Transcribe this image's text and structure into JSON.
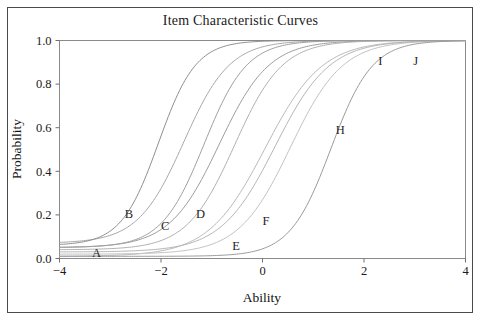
{
  "figure": {
    "title": "Item Characteristic Curves",
    "background_color": "#ffffff",
    "frame_color": "#4a4a4a"
  },
  "chart_data": {
    "type": "line",
    "title": "Item Characteristic Curves",
    "xlabel": "Ability",
    "ylabel": "Probability",
    "xlim": [
      -4,
      4
    ],
    "ylim": [
      0.0,
      1.0
    ],
    "xticks": [
      -4,
      -2,
      0,
      2,
      4
    ],
    "xtick_labels": [
      "−4",
      "−2",
      "0",
      "2",
      "4"
    ],
    "yticks": [
      0.0,
      0.2,
      0.4,
      0.6,
      0.8,
      1.0
    ],
    "ytick_labels": [
      "0.0",
      "0.2",
      "0.4",
      "0.6",
      "0.8",
      "1.0"
    ],
    "grid": false,
    "legend": "inline-labels",
    "model": "3PL logistic item characteristic curves",
    "x": [
      -4,
      -3.5,
      -3,
      -2.5,
      -2,
      -1.5,
      -1,
      -0.5,
      0,
      0.5,
      1,
      1.5,
      2,
      2.5,
      3,
      3.5,
      4
    ],
    "series": [
      {
        "name": "A",
        "label": "A",
        "label_x": -3.27,
        "label_y": 0.025,
        "color": "#b9b9b9",
        "discrimination": 1.05,
        "difficulty": 0.05,
        "guessing": 0.01,
        "values": [
          0.02,
          0.026,
          0.035,
          0.049,
          0.073,
          0.112,
          0.173,
          0.264,
          0.385,
          0.523,
          0.655,
          0.762,
          0.841,
          0.895,
          0.931,
          0.954,
          0.97
        ]
      },
      {
        "name": "B",
        "label": "B",
        "label_x": -2.63,
        "label_y": 0.205,
        "color": "#a8a8a8",
        "discrimination": 1.3,
        "difficulty": -1.55,
        "guessing": 0.07,
        "values": [
          0.09,
          0.118,
          0.16,
          0.224,
          0.315,
          0.432,
          0.56,
          0.681,
          0.781,
          0.855,
          0.906,
          0.94,
          0.962,
          0.976,
          0.985,
          0.99,
          0.994
        ]
      },
      {
        "name": "C",
        "label": "C",
        "label_x": -1.92,
        "label_y": 0.148,
        "color": "#9c9c9c",
        "discrimination": 1.2,
        "difficulty": -0.85,
        "guessing": 0.05,
        "values": [
          0.063,
          0.08,
          0.105,
          0.141,
          0.192,
          0.266,
          0.364,
          0.482,
          0.607,
          0.72,
          0.81,
          0.875,
          0.919,
          0.948,
          0.967,
          0.979,
          0.987
        ]
      },
      {
        "name": "D",
        "label": "D",
        "label_x": -1.22,
        "label_y": 0.205,
        "color": "#b0b0b0",
        "discrimination": 1.25,
        "difficulty": -0.55,
        "guessing": 0.04,
        "values": [
          0.05,
          0.063,
          0.082,
          0.11,
          0.151,
          0.212,
          0.298,
          0.409,
          0.535,
          0.659,
          0.764,
          0.843,
          0.898,
          0.935,
          0.959,
          0.974,
          0.984
        ]
      },
      {
        "name": "E",
        "label": "E",
        "label_x": -0.52,
        "label_y": 0.06,
        "color": "#c2c2c2",
        "discrimination": 1.15,
        "difficulty": 0.55,
        "guessing": 0.02,
        "values": [
          0.026,
          0.033,
          0.044,
          0.06,
          0.084,
          0.121,
          0.174,
          0.249,
          0.345,
          0.456,
          0.57,
          0.675,
          0.762,
          0.83,
          0.879,
          0.914,
          0.939
        ]
      },
      {
        "name": "F",
        "label": "F",
        "label_x": 0.07,
        "label_y": 0.175,
        "color": "#b5b5b5",
        "discrimination": 1.1,
        "difficulty": 0.25,
        "guessing": 0.03,
        "values": [
          0.037,
          0.046,
          0.06,
          0.081,
          0.111,
          0.155,
          0.218,
          0.302,
          0.405,
          0.519,
          0.63,
          0.727,
          0.804,
          0.862,
          0.903,
          0.932,
          0.952
        ]
      },
      {
        "name": "H",
        "label": "H",
        "label_x": 1.53,
        "label_y": 0.59,
        "color": "#9a9a9a",
        "discrimination": 1.45,
        "difficulty": 1.35,
        "guessing": 0.01,
        "values": [
          0.012,
          0.015,
          0.021,
          0.029,
          0.041,
          0.059,
          0.087,
          0.129,
          0.19,
          0.277,
          0.388,
          0.513,
          0.636,
          0.743,
          0.827,
          0.887,
          0.928
        ]
      },
      {
        "name": "I",
        "label": "I",
        "label_x": 2.32,
        "label_y": 0.905,
        "color": "#8f8f8f",
        "discrimination": 1.6,
        "difficulty": -2.05,
        "guessing": 0.06,
        "values": [
          0.123,
          0.181,
          0.261,
          0.366,
          0.49,
          0.616,
          0.727,
          0.814,
          0.876,
          0.918,
          0.947,
          0.965,
          0.978,
          0.986,
          0.991,
          0.994,
          0.996
        ]
      },
      {
        "name": "J",
        "label": "J",
        "label_x": 3.02,
        "label_y": 0.905,
        "color": "#a0a0a0",
        "discrimination": 1.4,
        "difficulty": -1.15,
        "guessing": 0.05,
        "values": [
          0.068,
          0.09,
          0.122,
          0.17,
          0.238,
          0.333,
          0.452,
          0.58,
          0.7,
          0.797,
          0.868,
          0.915,
          0.946,
          0.966,
          0.978,
          0.986,
          0.991
        ]
      }
    ]
  }
}
